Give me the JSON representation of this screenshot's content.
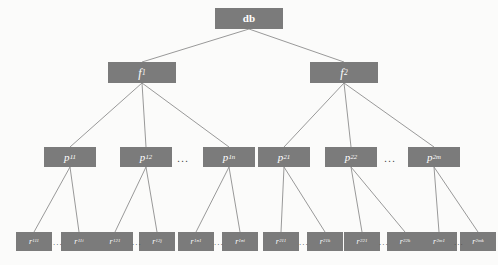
{
  "diagram": {
    "colors": {
      "node_fill": "#7b7b7b",
      "node_text": "#ffffff",
      "edge": "#8d8d8d",
      "background": "#fbfbfa"
    },
    "levels": [
      {
        "name": "root",
        "nodes": [
          {
            "id": "db",
            "base": "db",
            "sub": "",
            "x": 215,
            "y": 8,
            "w": 68,
            "h": 21
          }
        ]
      },
      {
        "name": "file",
        "nodes": [
          {
            "id": "f1",
            "base": "f",
            "sub": "1",
            "x": 108,
            "y": 62,
            "w": 68,
            "h": 21
          },
          {
            "id": "f2",
            "base": "f",
            "sub": "2",
            "x": 310,
            "y": 62,
            "w": 68,
            "h": 21
          }
        ]
      },
      {
        "name": "page",
        "nodes": [
          {
            "id": "p11",
            "base": "p",
            "sub": "11",
            "x": 44,
            "y": 147,
            "w": 52,
            "h": 20
          },
          {
            "id": "p12",
            "base": "p",
            "sub": "12",
            "x": 120,
            "y": 147,
            "w": 52,
            "h": 20
          },
          {
            "id": "p1n",
            "base": "p",
            "sub": "1n",
            "x": 203,
            "y": 147,
            "w": 52,
            "h": 20
          },
          {
            "id": "p21",
            "base": "p",
            "sub": "21",
            "x": 258,
            "y": 147,
            "w": 52,
            "h": 20
          },
          {
            "id": "p22",
            "base": "p",
            "sub": "22",
            "x": 325,
            "y": 147,
            "w": 52,
            "h": 20
          },
          {
            "id": "p2m",
            "base": "p",
            "sub": "2m",
            "x": 408,
            "y": 147,
            "w": 52,
            "h": 20
          }
        ],
        "ellipses": [
          {
            "id": "ell-p1",
            "text": "...",
            "x": 177,
            "y": 152
          },
          {
            "id": "ell-p2",
            "text": "...",
            "x": 384,
            "y": 152
          }
        ]
      },
      {
        "name": "record",
        "nodes": [
          {
            "id": "r111",
            "base": "r",
            "sub": "111",
            "x": 16,
            "y": 232,
            "w": 36,
            "h": 19
          },
          {
            "id": "r11i",
            "base": "r",
            "sub": "11i",
            "x": 61,
            "y": 232,
            "w": 36,
            "h": 19
          },
          {
            "id": "r121",
            "base": "r",
            "sub": "121",
            "x": 97,
            "y": 232,
            "w": 36,
            "h": 19
          },
          {
            "id": "r12j",
            "base": "r",
            "sub": "12j",
            "x": 139,
            "y": 232,
            "w": 36,
            "h": 19
          },
          {
            "id": "r1n1",
            "base": "r",
            "sub": "1n1",
            "x": 178,
            "y": 232,
            "w": 36,
            "h": 19
          },
          {
            "id": "r1ni",
            "base": "r",
            "sub": "1ni",
            "x": 222,
            "y": 232,
            "w": 36,
            "h": 19
          },
          {
            "id": "r211",
            "base": "r",
            "sub": "211",
            "x": 263,
            "y": 232,
            "w": 36,
            "h": 19
          },
          {
            "id": "r21k",
            "base": "r",
            "sub": "21k",
            "x": 307,
            "y": 232,
            "w": 36,
            "h": 19
          },
          {
            "id": "r221",
            "base": "r",
            "sub": "221",
            "x": 344,
            "y": 232,
            "w": 36,
            "h": 19
          },
          {
            "id": "r22k",
            "base": "r",
            "sub": "22k",
            "x": 387,
            "y": 232,
            "w": 36,
            "h": 19
          },
          {
            "id": "r2m1",
            "base": "r",
            "sub": "2m1",
            "x": 421,
            "y": 232,
            "w": 36,
            "h": 19
          },
          {
            "id": "r2mk",
            "base": "r",
            "sub": "2mk",
            "x": 460,
            "y": 232,
            "w": 36,
            "h": 19
          }
        ],
        "ellipses": [
          {
            "id": "ell-r1",
            "text": "...",
            "x": 53,
            "y": 238
          },
          {
            "id": "ell-r2",
            "text": "...",
            "x": 132,
            "y": 238
          },
          {
            "id": "ell-r3",
            "text": "...",
            "x": 214,
            "y": 238
          },
          {
            "id": "ell-r4",
            "text": "...",
            "x": 299,
            "y": 238
          },
          {
            "id": "ell-r5",
            "text": "...",
            "x": 379,
            "y": 238
          },
          {
            "id": "ell-r6",
            "text": "...",
            "x": 454,
            "y": 238
          }
        ]
      }
    ],
    "edges": [
      {
        "from": "db",
        "to": "f1"
      },
      {
        "from": "db",
        "to": "f2"
      },
      {
        "from": "f1",
        "to": "p11"
      },
      {
        "from": "f1",
        "to": "p12"
      },
      {
        "from": "f1",
        "to": "p1n"
      },
      {
        "from": "f2",
        "to": "p21"
      },
      {
        "from": "f2",
        "to": "p22"
      },
      {
        "from": "f2",
        "to": "p2m"
      },
      {
        "from": "p11",
        "to": "r111"
      },
      {
        "from": "p11",
        "to": "r11i"
      },
      {
        "from": "p12",
        "to": "r121"
      },
      {
        "from": "p12",
        "to": "r12j"
      },
      {
        "from": "p1n",
        "to": "r1n1"
      },
      {
        "from": "p1n",
        "to": "r1ni"
      },
      {
        "from": "p21",
        "to": "r211"
      },
      {
        "from": "p21",
        "to": "r21k"
      },
      {
        "from": "p22",
        "to": "r221"
      },
      {
        "from": "p22",
        "to": "r22k"
      },
      {
        "from": "p2m",
        "to": "r2m1"
      },
      {
        "from": "p2m",
        "to": "r2mk"
      }
    ]
  }
}
